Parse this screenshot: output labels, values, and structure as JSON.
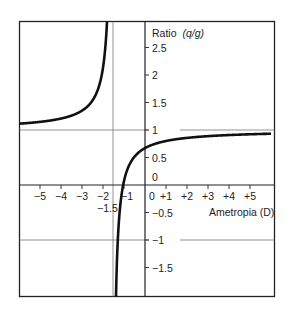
{
  "chart_data": {
    "type": "line",
    "title": "",
    "xlabel": "Ametropia (D)",
    "ylabel": "Ratio",
    "ylabel_italic": "(q/g)",
    "xlim": [
      -6,
      6
    ],
    "ylim": [
      -2,
      3
    ],
    "grid": false,
    "reference_lines": {
      "horizontal": [
        1,
        -1
      ],
      "vertical": [
        -1.5
      ]
    },
    "x_ticks": [
      {
        "value": -5,
        "label": "−5"
      },
      {
        "value": -4,
        "label": "−4"
      },
      {
        "value": -3,
        "label": "−3"
      },
      {
        "value": -2,
        "label": "−2"
      },
      {
        "value": -1,
        "label": "−1"
      },
      {
        "value": 0,
        "label": "0"
      },
      {
        "value": 1,
        "label": "+1"
      },
      {
        "value": 2,
        "label": "+2"
      },
      {
        "value": 3,
        "label": "+3"
      },
      {
        "value": 4,
        "label": "+4"
      },
      {
        "value": 5,
        "label": "+5"
      }
    ],
    "y_ticks": [
      {
        "value": 2.5,
        "label": "2.5"
      },
      {
        "value": 2,
        "label": "2"
      },
      {
        "value": 1.5,
        "label": "1.5"
      },
      {
        "value": 1,
        "label": "1"
      },
      {
        "value": 0.5,
        "label": "0.5"
      },
      {
        "value": 0,
        "label": "0"
      },
      {
        "value": -0.5,
        "label": "−0.5"
      },
      {
        "value": -1,
        "label": "−1"
      },
      {
        "value": -1.5,
        "label": "−1.5"
      }
    ],
    "annotations": [
      {
        "text": "−1.5",
        "x": -1.5,
        "y": -0.15,
        "note": "vertical asymptote position"
      }
    ],
    "series": [
      {
        "name": "Ratio (q/g) vs Ametropia",
        "asymptote_x": -1.55,
        "points": [
          {
            "x": -6,
            "y": 1.07
          },
          {
            "x": -5,
            "y": 1.12
          },
          {
            "x": -4,
            "y": 1.18
          },
          {
            "x": -3,
            "y": 1.33
          },
          {
            "x": -2.5,
            "y": 1.5
          },
          {
            "x": -2,
            "y": 1.9
          },
          {
            "x": -1.8,
            "y": 2.6
          },
          {
            "x": -1.72,
            "y": 3.0
          },
          {
            "x": -1.45,
            "y": -2.0
          },
          {
            "x": -1.3,
            "y": -1.0
          },
          {
            "x": -1.05,
            "y": 0.0
          },
          {
            "x": -0.5,
            "y": 0.5
          },
          {
            "x": 0,
            "y": 0.67
          },
          {
            "x": 1,
            "y": 0.8
          },
          {
            "x": 2,
            "y": 0.86
          },
          {
            "x": 3,
            "y": 0.89
          },
          {
            "x": 4,
            "y": 0.9
          },
          {
            "x": 5,
            "y": 0.92
          },
          {
            "x": 6,
            "y": 0.93
          }
        ]
      }
    ]
  },
  "labels": {
    "ylabel": "Ratio",
    "ylabel_italic": "(q/g)",
    "xlabel": "Ametropia (D)",
    "asymptote_label": "−1.5"
  }
}
